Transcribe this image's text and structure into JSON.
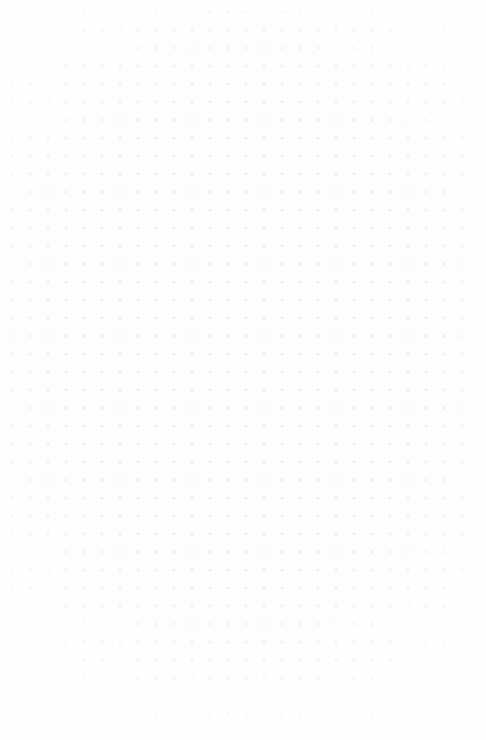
{
  "canvas": {
    "name": "dotted-grid-canvas",
    "width": 486,
    "height": 740,
    "background_color": "#fdfdfe",
    "state": "empty",
    "content_text": "",
    "grid": {
      "name": "dot-grid",
      "pattern": "dots",
      "dot_color": "#e6e6ec",
      "dot_diameter_px": 1.2,
      "spacing_x_px": 18,
      "spacing_y_px": 18,
      "origin_x_px": 21,
      "origin_y_px": 21,
      "columns": 26,
      "rows": 40,
      "margin_right_px": 15,
      "margin_bottom_px": 17,
      "visible": true
    },
    "vignette": {
      "name": "edge-vignette",
      "color": "#ffffff",
      "visible": true
    }
  }
}
